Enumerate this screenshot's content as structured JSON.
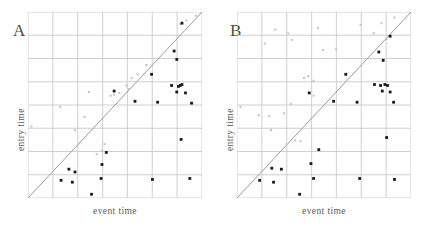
{
  "figure": {
    "width": 433,
    "height": 229,
    "background": "#ffffff"
  },
  "style": {
    "grid_color": "#c9c9c9",
    "diagonal_color": "#9a9a9a",
    "dark_point_color": "#1a1a1a",
    "faint_point_color": "#c2c2c2",
    "label_color": "#5a5a5a"
  },
  "chart_data": [
    {
      "type": "scatter",
      "panel": "A",
      "title": "A",
      "xlabel": "event time",
      "ylabel": "entry time",
      "xlim": [
        0,
        100
      ],
      "ylim": [
        0,
        100
      ],
      "grid": true,
      "xticks": [
        0,
        14.3,
        28.6,
        42.9,
        57.1,
        71.4,
        85.7,
        100
      ],
      "yticks": [
        0,
        12.5,
        25,
        37.5,
        50,
        62.5,
        75,
        87.5,
        100
      ],
      "xticklabels": [],
      "yticklabels": [],
      "legend": "none",
      "annotations": [
        {
          "text": "identity line y = x",
          "type": "reference-line",
          "from": [
            0,
            0
          ],
          "to": [
            100,
            100
          ]
        }
      ],
      "series": [
        {
          "name": "faint",
          "marker": "small-square",
          "color": "#c2c2c2",
          "points": [
            [
              2.0,
              38.5
            ],
            [
              18.5,
              49.0
            ],
            [
              27.0,
              36.5
            ],
            [
              29.5,
              29.5
            ],
            [
              32.5,
              43.5
            ],
            [
              35.0,
              57.0
            ],
            [
              39.5,
              23.5
            ],
            [
              42.5,
              25.5
            ],
            [
              44.0,
              29.0
            ],
            [
              47.5,
              55.0
            ],
            [
              49.5,
              55.5
            ],
            [
              52.5,
              56.5
            ],
            [
              56.5,
              60.5
            ],
            [
              58.0,
              58.5
            ],
            [
              59.5,
              64.5
            ],
            [
              63.0,
              66.5
            ],
            [
              68.0,
              71.5
            ],
            [
              87.5,
              93.5
            ],
            [
              91.0,
              95.5
            ],
            [
              96.5,
              98.0
            ]
          ]
        },
        {
          "name": "dark",
          "marker": "square",
          "color": "#1a1a1a",
          "points": [
            [
              88.5,
              94.0
            ],
            [
              84.0,
              79.0
            ],
            [
              85.5,
              74.5
            ],
            [
              71.0,
              66.5
            ],
            [
              82.5,
              60.5
            ],
            [
              86.5,
              60.0
            ],
            [
              87.5,
              60.5
            ],
            [
              88.5,
              61.0
            ],
            [
              85.5,
              57.0
            ],
            [
              90.5,
              56.5
            ],
            [
              61.5,
              52.0
            ],
            [
              74.5,
              51.5
            ],
            [
              94.0,
              51.0
            ],
            [
              49.5,
              57.5
            ],
            [
              88.0,
              31.5
            ],
            [
              45.0,
              24.5
            ],
            [
              42.5,
              18.0
            ],
            [
              27.0,
              14.0
            ],
            [
              23.5,
              15.5
            ],
            [
              19.0,
              9.5
            ],
            [
              25.5,
              8.5
            ],
            [
              42.0,
              10.5
            ],
            [
              71.5,
              10.0
            ],
            [
              93.0,
              10.5
            ],
            [
              36.5,
              2.0
            ]
          ]
        }
      ]
    },
    {
      "type": "scatter",
      "panel": "B",
      "title": "B",
      "xlabel": "event time",
      "ylabel": "entry time",
      "xlim": [
        0,
        100
      ],
      "ylim": [
        0,
        100
      ],
      "grid": true,
      "xticks": [
        0,
        14.3,
        28.6,
        42.9,
        57.1,
        71.4,
        85.7,
        100
      ],
      "yticks": [
        0,
        12.5,
        25,
        37.5,
        50,
        62.5,
        75,
        87.5,
        100
      ],
      "xticklabels": [],
      "yticklabels": [],
      "legend": "none",
      "annotations": [
        {
          "text": "identity line y = x",
          "type": "reference-line",
          "from": [
            0,
            0
          ],
          "to": [
            100,
            100
          ]
        }
      ],
      "series": [
        {
          "name": "faint",
          "marker": "small-square",
          "color": "#c2c2c2",
          "points": [
            [
              2.0,
              49.0
            ],
            [
              12.5,
              44.5
            ],
            [
              18.5,
              44.0
            ],
            [
              19.5,
              36.5
            ],
            [
              22.0,
              90.5
            ],
            [
              16.0,
              83.0
            ],
            [
              29.5,
              88.5
            ],
            [
              31.5,
              85.0
            ],
            [
              27.0,
              45.5
            ],
            [
              31.0,
              50.5
            ],
            [
              33.5,
              31.0
            ],
            [
              36.5,
              30.5
            ],
            [
              38.5,
              64.5
            ],
            [
              41.0,
              65.5
            ],
            [
              44.0,
              63.0
            ],
            [
              46.5,
              91.5
            ],
            [
              49.5,
              79.5
            ],
            [
              44.0,
              55.0
            ],
            [
              57.0,
              80.0
            ],
            [
              71.0,
              93.0
            ],
            [
              78.5,
              88.5
            ],
            [
              83.0,
              94.0
            ],
            [
              86.0,
              85.5
            ],
            [
              90.5,
              97.0
            ]
          ]
        },
        {
          "name": "dark",
          "marker": "square",
          "color": "#1a1a1a",
          "points": [
            [
              88.0,
              87.0
            ],
            [
              81.5,
              78.5
            ],
            [
              84.0,
              74.0
            ],
            [
              62.5,
              66.5
            ],
            [
              79.0,
              61.0
            ],
            [
              82.5,
              60.5
            ],
            [
              85.0,
              61.0
            ],
            [
              86.5,
              60.5
            ],
            [
              83.5,
              57.5
            ],
            [
              88.0,
              57.0
            ],
            [
              55.5,
              52.0
            ],
            [
              69.0,
              51.5
            ],
            [
              90.0,
              51.5
            ],
            [
              41.5,
              56.5
            ],
            [
              86.0,
              32.5
            ],
            [
              47.0,
              26.0
            ],
            [
              42.5,
              18.5
            ],
            [
              25.5,
              15.5
            ],
            [
              20.0,
              16.0
            ],
            [
              13.0,
              9.5
            ],
            [
              21.0,
              8.5
            ],
            [
              44.0,
              10.5
            ],
            [
              70.5,
              10.5
            ],
            [
              90.5,
              10.0
            ],
            [
              36.0,
              2.0
            ]
          ]
        }
      ]
    }
  ]
}
